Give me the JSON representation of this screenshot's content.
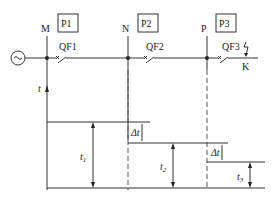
{
  "nodes": {
    "m": "M",
    "n": "N",
    "p": "P"
  },
  "protections": {
    "p1": "P1",
    "p2": "P2",
    "p3": "P3"
  },
  "breakers": {
    "qf1": "QF1",
    "qf2": "QF2",
    "qf3": "QF3"
  },
  "fault_point": "K",
  "axis_label": "t",
  "times": {
    "t1": "t",
    "t1_sub": "1",
    "t2": "t",
    "t2_sub": "2",
    "t3": "t",
    "t3_sub": "3"
  },
  "delta_t": "Δt",
  "colors": {
    "line": "#333333"
  }
}
